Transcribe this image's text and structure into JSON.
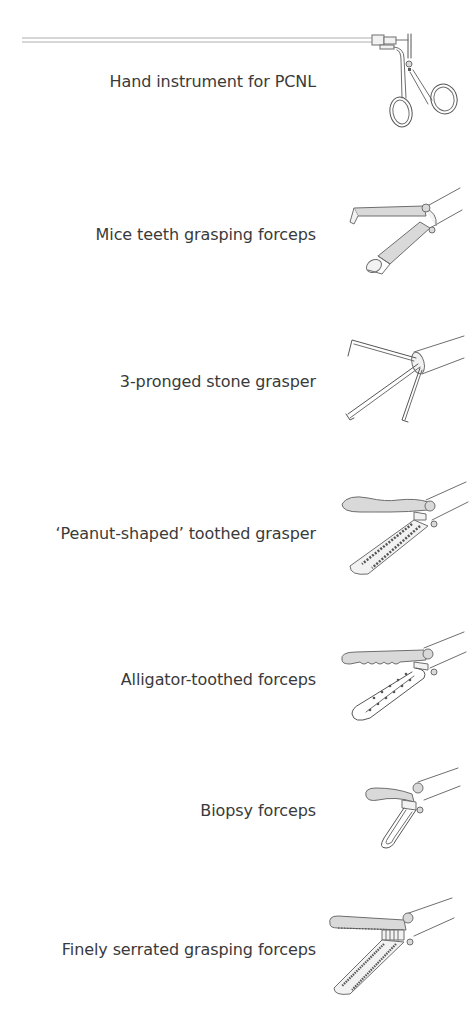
{
  "figure": {
    "items": [
      {
        "label": "Hand instrument for PCNL",
        "icon": "pcnl-hand-instrument-icon"
      },
      {
        "label": "Mice teeth grasping forceps",
        "icon": "mice-teeth-forceps-icon"
      },
      {
        "label": "3-pronged stone grasper",
        "icon": "three-pronged-grasper-icon"
      },
      {
        "label": "‘Peanut-shaped’ toothed grasper",
        "icon": "peanut-toothed-grasper-icon"
      },
      {
        "label": "Alligator-toothed forceps",
        "icon": "alligator-forceps-icon"
      },
      {
        "label": "Biopsy forceps",
        "icon": "biopsy-forceps-icon"
      },
      {
        "label": "Finely serrated grasping forceps",
        "icon": "serrated-forceps-icon"
      }
    ],
    "colors": {
      "text": "#3a3a3a",
      "line": "#6e6e6e",
      "background": "#ffffff"
    }
  }
}
